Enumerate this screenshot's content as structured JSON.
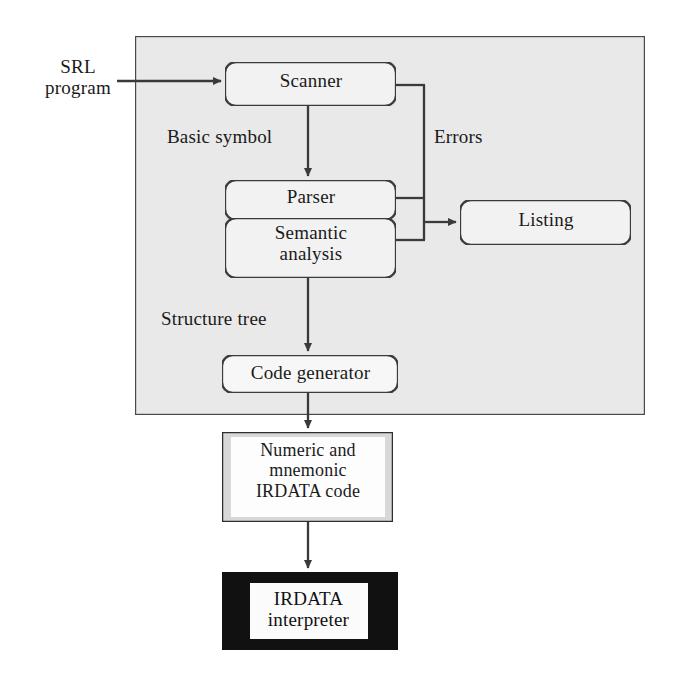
{
  "diagram": {
    "type": "flowchart",
    "colors": {
      "container_fill": "#e9e9e9",
      "container_stroke": "#4a4a4a",
      "node_fill": "#f2f2f2",
      "node_stroke": "#3a3a3a",
      "line": "#3a3a3a",
      "code_box_fill": "#d8d8d8",
      "code_box_inner": "#fdfdfd",
      "interpreter_fill": "#111111",
      "interpreter_text": "#111111",
      "page_background": "#ffffff"
    },
    "container": {
      "name": "SRL compiler",
      "x": 135,
      "y": 36,
      "width": 510,
      "height": 379
    },
    "nodes": [
      {
        "id": "scanner",
        "label": "Scanner",
        "shape": "rounded-rect",
        "x": 225,
        "y": 62,
        "width": 171,
        "height": 44
      },
      {
        "id": "parser",
        "label": "Parser",
        "shape": "rounded-rect",
        "x": 225,
        "y": 180,
        "width": 171,
        "height": 40
      },
      {
        "id": "semantic",
        "label": "Semantic\nanalysis",
        "shape": "rounded-rect",
        "x": 225,
        "y": 218,
        "width": 171,
        "height": 60
      },
      {
        "id": "listing",
        "label": "Listing",
        "shape": "rounded-rect",
        "x": 460,
        "y": 200,
        "width": 171,
        "height": 45
      },
      {
        "id": "codegen",
        "label": "Code generator",
        "shape": "rounded-rect",
        "x": 222,
        "y": 355,
        "width": 176,
        "height": 38
      },
      {
        "id": "irdatacode",
        "label": "Numeric and\nmnemonic\nIRDATA code",
        "shape": "rect",
        "x": 222,
        "y": 432,
        "width": 171,
        "height": 90
      },
      {
        "id": "interpreter",
        "label": "IRDATA\ninterpreter",
        "shape": "filled-rect",
        "x": 222,
        "y": 572,
        "width": 176,
        "height": 78
      }
    ],
    "edge_labels": [
      {
        "id": "input",
        "text": "SRL\nprogram",
        "x": 22,
        "y": 56
      },
      {
        "id": "basic",
        "text": "Basic symbol",
        "x": 167,
        "y": 126
      },
      {
        "id": "errors",
        "text": "Errors",
        "x": 434,
        "y": 126
      },
      {
        "id": "structure",
        "text": "Structure  tree",
        "x": 161,
        "y": 308
      }
    ],
    "edges": [
      {
        "id": "srl-to-scanner",
        "from": "srl-program",
        "to": "scanner",
        "label": "SRL program",
        "arrow": true
      },
      {
        "id": "scanner-to-parser",
        "from": "scanner",
        "to": "parser",
        "label": "Basic symbol",
        "arrow": true
      },
      {
        "id": "semantic-to-codegen",
        "from": "semantic",
        "to": "codegen",
        "label": "Structure tree",
        "arrow": true
      },
      {
        "id": "scanner-to-errors",
        "from": "scanner",
        "to": "errors-bus",
        "label": "Errors",
        "arrow": false
      },
      {
        "id": "parser-to-errors",
        "from": "parser",
        "to": "errors-bus",
        "label": "Errors",
        "arrow": false
      },
      {
        "id": "semantic-to-errors",
        "from": "semantic",
        "to": "errors-bus",
        "label": "Errors",
        "arrow": false
      },
      {
        "id": "errors-to-listing",
        "from": "errors-bus",
        "to": "listing",
        "label": "Errors",
        "arrow": true
      },
      {
        "id": "codegen-to-irdatacode",
        "from": "codegen",
        "to": "irdatacode",
        "label": "",
        "arrow": true
      },
      {
        "id": "irdatacode-to-interp",
        "from": "irdatacode",
        "to": "interpreter",
        "label": "",
        "arrow": true
      }
    ]
  }
}
